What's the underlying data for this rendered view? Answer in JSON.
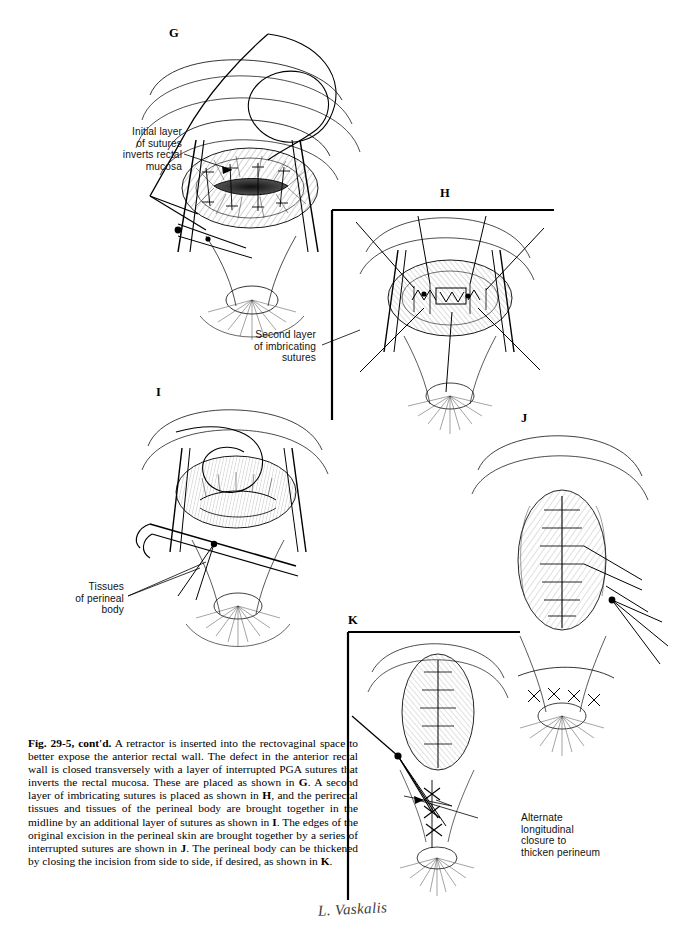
{
  "figure": {
    "caption_label": "Fig. 29-5, cont'd.",
    "caption_body": " A retractor is inserted into the rectovaginal space to better expose the anterior rectal wall. The defect in the anterior rectal wall is closed transversely with a layer of interrupted PGA sutures that inverts the rectal mucosa. These are placed as shown in ",
    "caption_ref_g": "G",
    "caption_seg2": ". A second layer of imbricating sutures is placed as shown in ",
    "caption_ref_h": "H",
    "caption_seg3": ", and the perirectal tissues and tissues of the perineal body are brought together in the midline by an additional layer of sutures as shown in ",
    "caption_ref_i": "I",
    "caption_seg4": ". The edges of the original excision in the perineal skin are brought together by a series of interrupted sutures are shown in ",
    "caption_ref_j": "J",
    "caption_seg5": ". The perineal body can be thickened by closing the incision from side to side, if desired, as shown in ",
    "caption_ref_k": "K",
    "caption_end": "."
  },
  "panels": [
    {
      "id": "G",
      "letter": "G"
    },
    {
      "id": "H",
      "letter": "H"
    },
    {
      "id": "I",
      "letter": "I"
    },
    {
      "id": "J",
      "letter": "J"
    },
    {
      "id": "K",
      "letter": "K"
    }
  ],
  "annotations": [
    {
      "id": "initial-layer",
      "text": "Initial layer\nof sutures\ninverts rectal\nmucosa"
    },
    {
      "id": "second-layer",
      "text": "Second layer\nof imbricating\nsutures"
    },
    {
      "id": "tissues-perineal-body",
      "text": "Tissues\nof perineal\nbody"
    },
    {
      "id": "alternate-closure",
      "text": "Alternate\nlongitudinal\nclosure to\nthicken perineum"
    }
  ],
  "signature": {
    "artist": "L. Vaskalis"
  },
  "colors": {
    "ink": "#000000",
    "page": "#ffffff",
    "caption_text": "#000000",
    "annotation_text": "#111111",
    "signature": "#3c3c3c"
  }
}
